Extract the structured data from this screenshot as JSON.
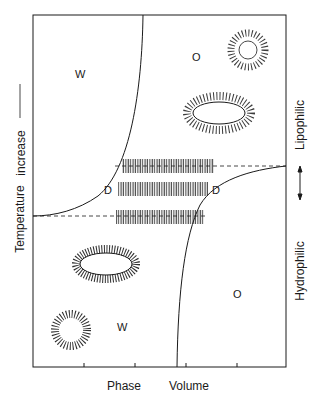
{
  "diagram": {
    "axes": {
      "x_label_left": "Phase",
      "x_label_right": "Volume",
      "y_label": "Temperature",
      "y_label_suffix": "increase",
      "right_label_top": "Lipophilic",
      "right_label_bottom": "Hydrophilic",
      "x_ticks_count": 4
    },
    "regions": {
      "w_top": "W",
      "o_top": "O",
      "d_left": "D",
      "d_right": "D",
      "w_bottom": "W",
      "o_bottom": "O"
    },
    "structures": [
      {
        "name": "reverse-spherical-micelle",
        "region": "O top"
      },
      {
        "name": "reverse-elongated-micelle",
        "region": "O top"
      },
      {
        "name": "lamellar-bilayer-stack",
        "region": "D",
        "count": 3
      },
      {
        "name": "elongated-micelle",
        "region": "W bottom"
      },
      {
        "name": "spherical-micelle",
        "region": "W bottom"
      }
    ],
    "colors": {
      "ink": "#1a1a1a",
      "background": "#ffffff"
    }
  }
}
